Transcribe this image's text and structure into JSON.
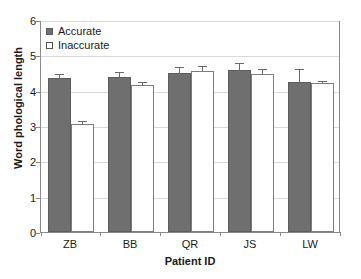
{
  "chart_data": {
    "type": "bar",
    "title": "",
    "subtitle": "",
    "xlabel": "Patient ID",
    "ylabel": "Word phological length",
    "categories": [
      "ZB",
      "BB",
      "QR",
      "JS",
      "LW"
    ],
    "series": [
      {
        "name": "Accurate",
        "color": "#6f6f6f",
        "values": [
          4.35,
          4.4,
          4.5,
          4.58,
          4.25
        ],
        "errors": [
          0.13,
          0.12,
          0.17,
          0.2,
          0.37
        ]
      },
      {
        "name": "Inaccurate",
        "color": "#ffffff",
        "values": [
          3.05,
          4.15,
          4.57,
          4.47,
          4.23
        ],
        "errors": [
          0.08,
          0.1,
          0.13,
          0.13,
          0.05
        ]
      }
    ],
    "ylim": [
      0,
      6
    ],
    "yticks": [
      0,
      1,
      2,
      3,
      4,
      5,
      6
    ],
    "ytick_labels": [
      "0",
      "1",
      "2",
      "3",
      "4",
      "5",
      "6"
    ],
    "grid": true,
    "grid_axis": "y",
    "legend_position": "top-left",
    "legend_entries": [
      "Accurate",
      "Inaccurate"
    ]
  },
  "colors": {
    "accurate_fill": "#6f6f6f",
    "accurate_edge": "#5c5c5c",
    "inaccurate_fill": "#ffffff",
    "inaccurate_edge": "#7d7d7d",
    "gridline": "#d9d9d9",
    "axis": "#8a8a8a",
    "error_bar": "#6a6a6a",
    "background": "#ffffff",
    "text": "#1a1a1a"
  }
}
